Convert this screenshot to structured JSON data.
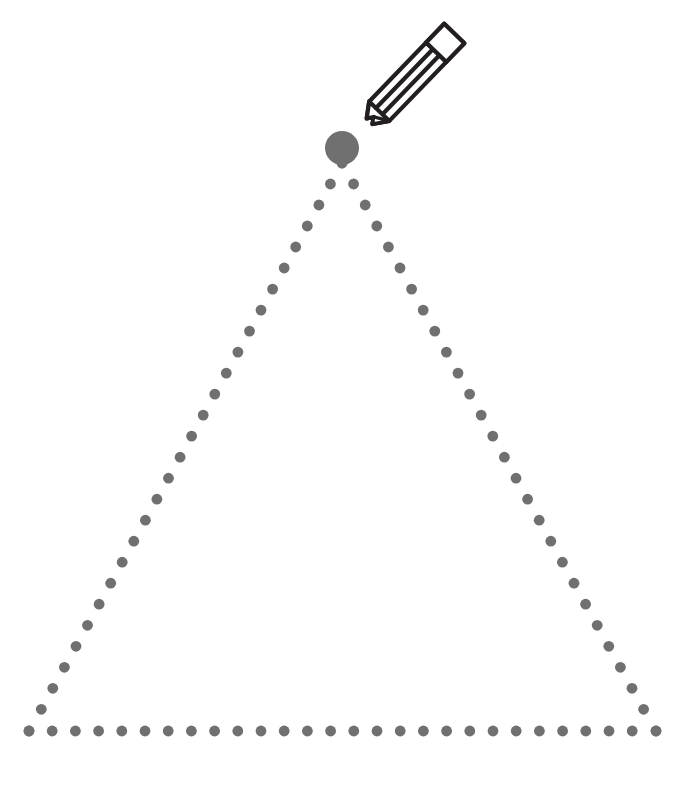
{
  "page": {
    "title": "Dotted Triangle Tracing Worksheet",
    "background_color": "#ffffff",
    "width": 675,
    "height": 787
  },
  "shape": {
    "name": "triangle",
    "label": "Dotted triangle outline",
    "style": "dotted-guide",
    "dot_color": "#707070",
    "dot_radius": 5.4,
    "dot_spacing": 23.2,
    "vertices": {
      "apex": {
        "x": 342,
        "y": 163
      },
      "bottom_left": {
        "x": 29,
        "y": 731
      },
      "bottom_right": {
        "x": 656,
        "y": 731
      }
    },
    "edges": [
      {
        "name": "left-edge",
        "from": "apex",
        "to": "bottom_left",
        "dot_count": 28
      },
      {
        "name": "right-edge",
        "from": "apex",
        "to": "bottom_right",
        "dot_count": 28
      },
      {
        "name": "base-edge",
        "from": "bottom_left",
        "to": "bottom_right",
        "dot_count": 28
      }
    ]
  },
  "start_marker": {
    "name": "start-point",
    "label": "Starting point",
    "color": "#707070",
    "center": {
      "x": 342,
      "y": 148
    },
    "radius": 17
  },
  "pencil": {
    "name": "pencil",
    "label": "Pencil",
    "outline_color": "#231f20",
    "fill_color": "#ffffff",
    "stroke_width": 4.2,
    "tip": {
      "x": 364,
      "y": 127
    },
    "eraser_end": {
      "x": 470,
      "y": 17
    },
    "rotation_degrees": -46
  },
  "chart_data": {
    "type": "scatter",
    "xlabel": "",
    "ylabel": "",
    "xlim": [
      0,
      675
    ],
    "ylim": [
      787,
      0
    ],
    "grid": false,
    "legend": null,
    "series": [
      {
        "name": "left-edge",
        "marker": "circle",
        "color": "#707070",
        "size": 10.8,
        "x": [
          342,
          330.4,
          318.9,
          307.3,
          295.7,
          284.2,
          272.6,
          261.0,
          249.5,
          237.9,
          226.3,
          214.8,
          203.2,
          191.6,
          180.1,
          168.5,
          156.9,
          145.4,
          133.8,
          122.2,
          110.7,
          99.1,
          87.5,
          76.0,
          64.4,
          52.8,
          41.3,
          29
        ],
        "y": [
          163,
          184.0,
          205.0,
          226.0,
          247.0,
          268.0,
          289.1,
          310.1,
          331.1,
          352.1,
          373.1,
          394.1,
          415.1,
          436.1,
          457.2,
          478.2,
          499.2,
          520.2,
          541.2,
          562.2,
          583.2,
          604.2,
          625.3,
          646.3,
          667.3,
          688.3,
          709.3,
          731
        ]
      },
      {
        "name": "right-edge",
        "marker": "circle",
        "color": "#707070",
        "size": 10.8,
        "x": [
          342,
          353.6,
          365.2,
          376.8,
          388.4,
          400.0,
          411.6,
          423.2,
          434.8,
          446.4,
          458.0,
          469.6,
          481.2,
          492.8,
          504.4,
          516.0,
          527.6,
          539.2,
          550.8,
          562.4,
          574.0,
          585.6,
          597.2,
          608.8,
          620.4,
          632.0,
          643.6,
          656
        ],
        "y": [
          163,
          184.0,
          205.0,
          226.0,
          247.0,
          268.0,
          289.1,
          310.1,
          331.1,
          352.1,
          373.1,
          394.1,
          415.1,
          436.1,
          457.2,
          478.2,
          499.2,
          520.2,
          541.2,
          562.2,
          583.2,
          604.2,
          625.3,
          646.3,
          667.3,
          688.3,
          709.3,
          731
        ]
      },
      {
        "name": "base-edge",
        "marker": "circle",
        "color": "#707070",
        "size": 10.8,
        "x": [
          29,
          52.2,
          75.4,
          98.6,
          121.8,
          145.0,
          168.2,
          191.4,
          214.6,
          237.8,
          261.0,
          284.2,
          307.4,
          330.6,
          353.8,
          377.0,
          400.2,
          423.4,
          446.6,
          469.8,
          493.0,
          516.2,
          539.4,
          562.6,
          585.8,
          609.0,
          632.2,
          656
        ],
        "y": [
          731,
          731,
          731,
          731,
          731,
          731,
          731,
          731,
          731,
          731,
          731,
          731,
          731,
          731,
          731,
          731,
          731,
          731,
          731,
          731,
          731,
          731,
          731,
          731,
          731,
          731,
          731,
          731
        ]
      },
      {
        "name": "start-point",
        "marker": "circle",
        "color": "#707070",
        "size": 34,
        "x": [
          342
        ],
        "y": [
          148
        ]
      }
    ]
  }
}
